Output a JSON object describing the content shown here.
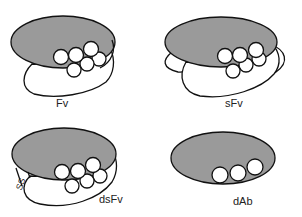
{
  "colors": {
    "heavy_domain_fill": "#9a9a9a",
    "light_domain_fill": "#ffffff",
    "outline": "#111111",
    "loop_fill": "#ffffff",
    "background": "#ffffff"
  },
  "panels": [
    {
      "id": "fv",
      "label": "Fv",
      "position": "top-left",
      "components": [
        "heavy-domain",
        "light-domain",
        "cdr-loops-6"
      ]
    },
    {
      "id": "sfv",
      "label": "sFv",
      "position": "top-right",
      "components": [
        "heavy-domain",
        "light-domain",
        "peptide-linker",
        "cdr-loops-6"
      ]
    },
    {
      "id": "dsfv",
      "label": "dsFv",
      "position": "bottom-left",
      "components": [
        "heavy-domain",
        "light-domain",
        "disulfide-bond",
        "cdr-loops-6"
      ],
      "bond_label": "SS"
    },
    {
      "id": "dab",
      "label": "dAb",
      "position": "bottom-right",
      "components": [
        "heavy-domain",
        "cdr-loops-3"
      ]
    }
  ]
}
